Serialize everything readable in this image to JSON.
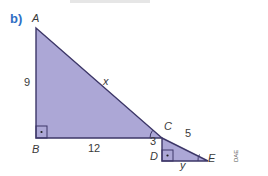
{
  "part_label": "b)",
  "vertices": {
    "A": "A",
    "B": "B",
    "C": "C",
    "D": "D",
    "E": "E"
  },
  "side_labels": {
    "AB": "9",
    "BC": "12",
    "AC": "x",
    "CD": "3",
    "CE": "5",
    "DE": "y"
  },
  "credit": "DAE",
  "colors": {
    "fill": "#aca7d6",
    "stroke": "#3d3768",
    "part_label": "#2f6fc4"
  }
}
